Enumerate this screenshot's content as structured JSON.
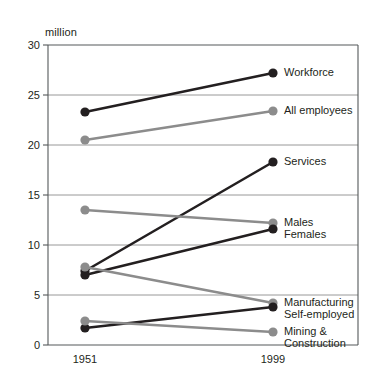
{
  "caption_clipped": "changing composition of employment in the UK",
  "chart_data": {
    "type": "line",
    "title": "",
    "subtitle": "",
    "xlabel": "",
    "ylabel": "million",
    "unit_label": "million",
    "x": [
      "1951",
      "1999"
    ],
    "categories": [
      "1951",
      "1999"
    ],
    "xtick_labels": [
      "1951",
      "1999"
    ],
    "ytick_labels": [
      "0",
      "5",
      "10",
      "15",
      "20",
      "25",
      "30"
    ],
    "yticks": [
      0,
      5,
      10,
      15,
      20,
      25,
      30
    ],
    "ylim": [
      0,
      30
    ],
    "grid": "horizontal",
    "legend": "inline-right-labels",
    "colors": {
      "dark": "#231f20",
      "gray": "#8c8c8c",
      "gridline": "#8c8c8c",
      "frame": "#55585a"
    },
    "series": [
      {
        "name": "Workforce",
        "color_key": "dark",
        "values": [
          23.3,
          27.2
        ]
      },
      {
        "name": "All employees",
        "color_key": "gray",
        "values": [
          20.5,
          23.4
        ]
      },
      {
        "name": "Services",
        "color_key": "dark",
        "values": [
          7.4,
          18.3
        ]
      },
      {
        "name": "Males",
        "color_key": "gray",
        "values": [
          13.5,
          12.2
        ]
      },
      {
        "name": "Females",
        "color_key": "dark",
        "values": [
          7.0,
          11.6
        ]
      },
      {
        "name": "Manufacturing",
        "color_key": "gray",
        "values": [
          7.8,
          4.2
        ]
      },
      {
        "name": "Self-employed",
        "color_key": "dark",
        "values": [
          1.7,
          3.8
        ]
      },
      {
        "name": "Mining & Construction",
        "color_key": "gray",
        "values": [
          2.4,
          1.3
        ]
      }
    ],
    "annotations": [
      {
        "text": "Workforce",
        "at_series": "Workforce"
      },
      {
        "text": "All employees",
        "at_series": "All employees"
      },
      {
        "text": "Services",
        "at_series": "Services"
      },
      {
        "text": "Males",
        "at_series": "Males"
      },
      {
        "text": "Females",
        "at_series": "Females"
      },
      {
        "text": "Manufacturing",
        "at_series": "Manufacturing"
      },
      {
        "text": "Self-employed",
        "at_series": "Self-employed"
      },
      {
        "text": "Mining &",
        "at_series": "Mining & Construction"
      },
      {
        "text": "Construction",
        "at_series": "Mining & Construction"
      }
    ]
  }
}
